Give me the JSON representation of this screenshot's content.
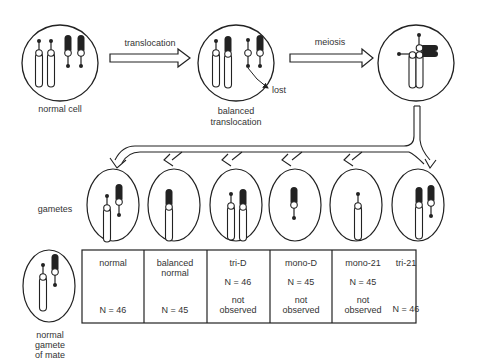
{
  "top_row": {
    "normal_cell_label": "normal cell",
    "arrow1_label": "translocation",
    "balanced_label_line1": "balanced",
    "balanced_label_line2": "translocation",
    "lost_label": "lost",
    "arrow2_label": "meiosis"
  },
  "gametes_label": "gametes",
  "mate": {
    "line1": "normal",
    "line2": "gamete",
    "line3": "of mate"
  },
  "table": {
    "columns": [
      {
        "title_line1": "normal",
        "title_line2": "",
        "n": "N = 46",
        "note_line1": "",
        "note_line2": ""
      },
      {
        "title_line1": "balanced",
        "title_line2": "normal",
        "n": "N = 45",
        "note_line1": "",
        "note_line2": ""
      },
      {
        "title_line1": "tri-D",
        "title_line2": "",
        "n": "N = 46",
        "note_line1": "not",
        "note_line2": "observed"
      },
      {
        "title_line1": "mono-D",
        "title_line2": "",
        "n": "N = 45",
        "note_line1": "not",
        "note_line2": "observed"
      },
      {
        "title_line1": "mono-21",
        "title_line2": "",
        "n": "N = 45",
        "note_line1": "not",
        "note_line2": "observed"
      },
      {
        "title_line1": "tri-21",
        "title_line2": "",
        "n": "N = 46",
        "note_line1": "",
        "note_line2": ""
      }
    ]
  },
  "colors": {
    "ink": "#222222",
    "background": "#ffffff"
  }
}
